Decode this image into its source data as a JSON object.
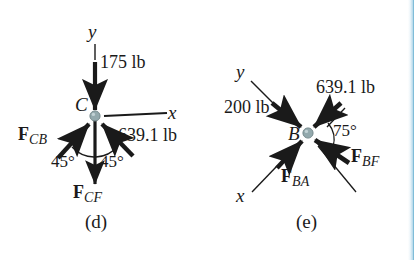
{
  "figure": {
    "type": "free-body-diagram-pair",
    "background_color": "#ffffff",
    "ink_color": "#1a1a1a",
    "node_color": "#93a9ad",
    "edge_accent_color": "#8cc3dd"
  },
  "panel_d": {
    "caption": "(d)",
    "node_label": "C",
    "axis_y_label": "y",
    "axis_x_label": "x",
    "applied_load": "175 lb",
    "member_force_right": "639.1 lb",
    "force_cb": {
      "bold": "F",
      "sub": "CB"
    },
    "force_cf": {
      "bold": "F",
      "sub": "CF"
    },
    "angle_left": "45°",
    "angle_right": "45°"
  },
  "panel_e": {
    "caption": "(e)",
    "node_label": "B",
    "axis_y_label": "y",
    "axis_x_label": "x",
    "applied_load": "200 lb",
    "member_force_upper_right": "639.1 lb",
    "force_ba": {
      "bold": "F",
      "sub": "BA"
    },
    "force_bf": {
      "bold": "F",
      "sub": "BF"
    },
    "angle": "75°"
  }
}
